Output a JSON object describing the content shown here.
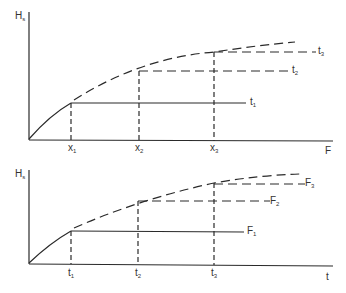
{
  "figure": {
    "top_panel": {
      "y_axis_label": {
        "main": "H",
        "sub": "s"
      },
      "x_axis_label": "F",
      "x_ticks": [
        {
          "main": "x",
          "sub": "1"
        },
        {
          "main": "x",
          "sub": "2"
        },
        {
          "main": "x",
          "sub": "3"
        }
      ],
      "curve_labels": [
        {
          "main": "t",
          "sub": "1"
        },
        {
          "main": "t",
          "sub": "2"
        },
        {
          "main": "t",
          "sub": "3"
        }
      ]
    },
    "bottom_panel": {
      "y_axis_label": {
        "main": "H",
        "sub": "s"
      },
      "x_axis_label": "t",
      "x_ticks": [
        {
          "main": "t",
          "sub": "1"
        },
        {
          "main": "t",
          "sub": "2"
        },
        {
          "main": "t",
          "sub": "3"
        }
      ],
      "curve_labels": [
        {
          "main": "F",
          "sub": "1"
        },
        {
          "main": "F",
          "sub": "2"
        },
        {
          "main": "F",
          "sub": "3"
        }
      ]
    },
    "colors": {
      "line": "#2a2a2a",
      "background": "#ffffff"
    }
  }
}
